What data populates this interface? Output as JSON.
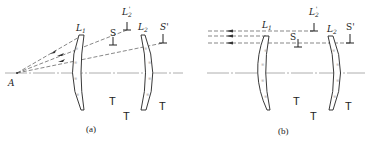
{
  "figure": {
    "panels": [
      {
        "id": "a",
        "caption": "(a)",
        "point_label": "A",
        "lens1_label": "L",
        "lens1_sub": "1",
        "lens2_label": "L",
        "lens2_sub": "2",
        "stop_label": "S",
        "stop_image_label": "S'",
        "lens2_image_label": "L",
        "lens2_image_sub": "2",
        "lens2_image_prime": "'",
        "rays": "diverging from point A",
        "tick_glyph": "T"
      },
      {
        "id": "b",
        "caption": "(b)",
        "lens1_label": "L",
        "lens1_sub": "1",
        "lens2_label": "L",
        "lens2_sub": "2",
        "stop_label": "S",
        "stop_image_label": "S'",
        "lens2_image_label": "L",
        "lens2_image_sub": "2",
        "lens2_image_prime": "'",
        "rays": "parallel (object at infinity)",
        "tick_glyph": "T"
      }
    ],
    "colors": {
      "line": "#222222",
      "axis": "#888888",
      "ray": "#555555",
      "hatch": "#999999"
    }
  }
}
